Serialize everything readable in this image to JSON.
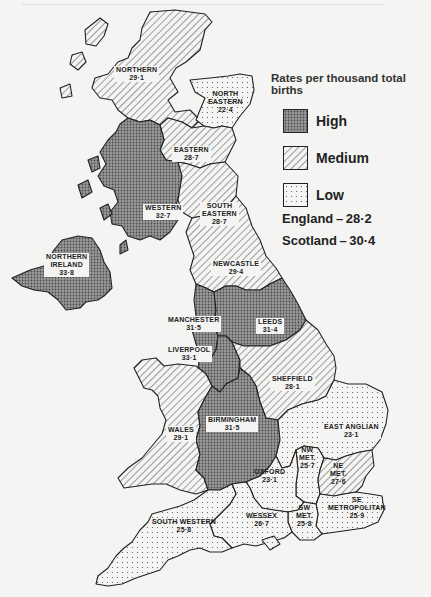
{
  "legend": {
    "title": "Rates per thousand total births",
    "items": [
      {
        "key": "high",
        "label": "High"
      },
      {
        "key": "medium",
        "label": "Medium"
      },
      {
        "key": "low",
        "label": "Low"
      }
    ]
  },
  "totals": {
    "england": "England – 28·2",
    "scotland": "Scotland – 30·4"
  },
  "regions": {
    "northern": {
      "name": "NORTHERN",
      "value": "29·1",
      "category": "medium"
    },
    "north_eastern": {
      "name_1": "NORTH",
      "name_2": "EASTERN",
      "value": "22·4",
      "category": "low"
    },
    "eastern": {
      "name": "EASTERN",
      "value": "28·7",
      "category": "medium"
    },
    "western": {
      "name": "WESTERN",
      "value": "32·7",
      "category": "high"
    },
    "south_eastern": {
      "name_1": "SOUTH",
      "name_2": "EASTERN",
      "value": "28·7",
      "category": "medium"
    },
    "northern_ireland": {
      "name_1": "NORTHERN",
      "name_2": "IRELAND",
      "value": "33·8",
      "category": "high"
    },
    "newcastle": {
      "name": "NEWCASTLE",
      "value": "29·4",
      "category": "medium"
    },
    "manchester": {
      "name": "MANCHESTER",
      "value": "31·5",
      "category": "high"
    },
    "leeds": {
      "name": "LEEDS",
      "value": "31·4",
      "category": "high"
    },
    "liverpool": {
      "name": "LIVERPOOL",
      "value": "33·1",
      "category": "high"
    },
    "sheffield": {
      "name": "SHEFFIELD",
      "value": "28·1",
      "category": "medium"
    },
    "wales": {
      "name": "WALES",
      "value": "29·1",
      "category": "medium"
    },
    "birmingham": {
      "name": "BIRMINGHAM",
      "value": "31·5",
      "category": "high"
    },
    "east_anglian": {
      "name": "EAST ANGLIAN",
      "value": "23·1",
      "category": "low"
    },
    "nw_met": {
      "name_1": "NW",
      "name_2": "MET.",
      "value": "25·7",
      "category": "low"
    },
    "ne_met": {
      "name_1": "NE",
      "name_2": "MET.",
      "value": "27·6",
      "category": "medium"
    },
    "oxford": {
      "name": "OXFORD",
      "value": "23·1",
      "category": "low"
    },
    "se_metropolitan": {
      "name_1": "SE",
      "name_2": "METROPOLITAN",
      "value": "25·9",
      "category": "low"
    },
    "sw_met": {
      "name_1": "SW",
      "name_2": "MET.",
      "value": "25·8",
      "category": "low"
    },
    "wessex": {
      "name": "WESSEX",
      "value": "26·7",
      "category": "low"
    },
    "south_western": {
      "name": "SOUTH WESTERN",
      "value": "25·8",
      "category": "low"
    }
  },
  "colors": {
    "high_fill": "#8a8a8a",
    "medium_hatch": "#555555",
    "low_dots": "#777777",
    "background": "#f4f4f2"
  }
}
